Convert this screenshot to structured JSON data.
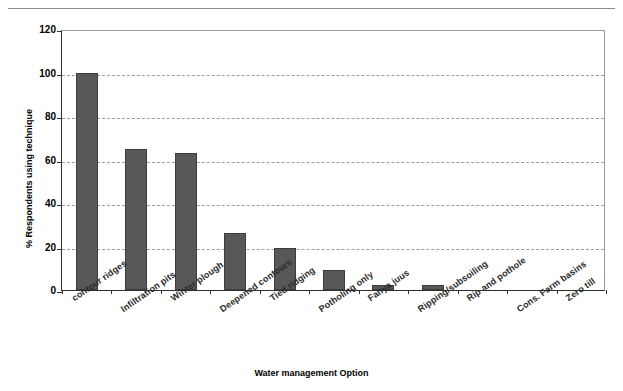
{
  "chart_data": {
    "type": "bar",
    "title": "",
    "xlabel": "Water management Option",
    "ylabel": "% Respondents using technique",
    "ylim": [
      0,
      120
    ],
    "yticks": [
      0,
      20,
      40,
      60,
      80,
      100,
      120
    ],
    "grid": true,
    "legend": "none",
    "bar_color": "#585858",
    "categories": [
      "contour ridges",
      "Infiltration pits",
      "Winter plough",
      "Deepened contours",
      "Tied ridging",
      "Potholing only",
      "Fanya juus",
      "Ripping/subsoiling",
      "Rip and pothole",
      "Cons. Farm basins",
      "Zero till"
    ],
    "values": [
      100,
      65,
      63,
      26,
      19.5,
      9,
      2.5,
      2.5,
      0,
      0,
      0
    ]
  },
  "axes": {
    "y_tick_labels": [
      "0",
      "20",
      "40",
      "60",
      "80",
      "100",
      "120"
    ],
    "y_axis_title": "% Respondents using technique",
    "x_axis_title": "Water management Option"
  },
  "ghost_text": ""
}
